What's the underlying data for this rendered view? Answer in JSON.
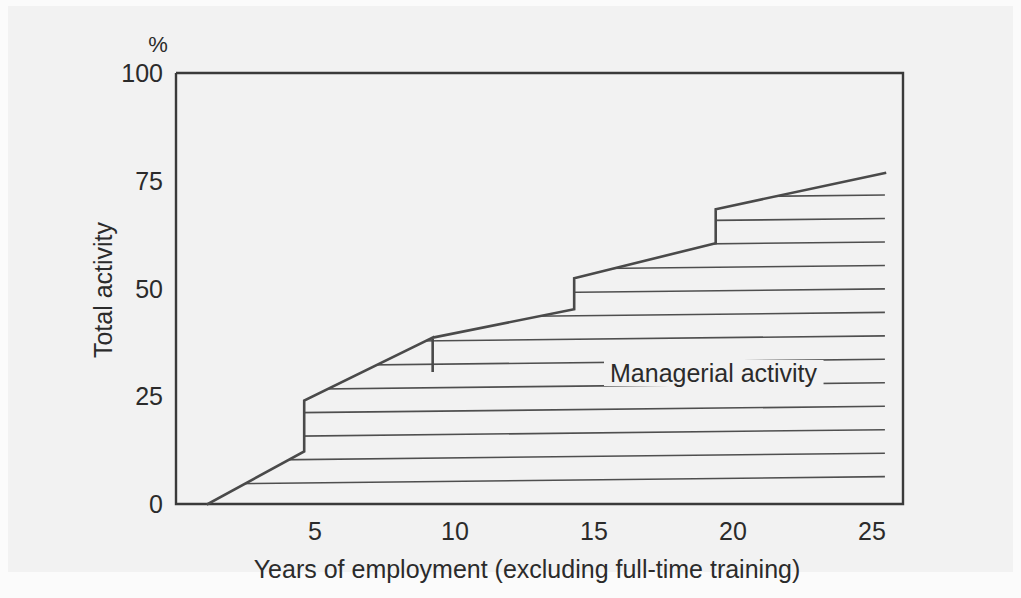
{
  "chart_data": {
    "type": "area",
    "title": "",
    "xlabel": "Years of employment (excluding full-time training)",
    "ylabel": "Total activity",
    "yunit": "%",
    "xlim": [
      0,
      26.2
    ],
    "ylim": [
      0,
      100
    ],
    "xticks": [
      5,
      10,
      15,
      20,
      25
    ],
    "xticklabels": [
      "5",
      "10",
      "15",
      "20",
      "25"
    ],
    "yticks": [
      0,
      25,
      50,
      75,
      100
    ],
    "yticklabels": [
      "0",
      "25",
      "50",
      "75",
      "100"
    ],
    "grid": false,
    "legend": "none",
    "annotations": [
      {
        "text": "Managerial activity",
        "x": 15.6,
        "y": 33.5
      }
    ],
    "series": [
      {
        "name": "Total activity",
        "comment": "Upper staircase boundary: cumulative activity rises linearly then steps up at promotions",
        "points": [
          {
            "x": 1.15,
            "y": 0
          },
          {
            "x": 4.62,
            "y": 12.2
          },
          {
            "x": 4.62,
            "y": 24.0
          },
          {
            "x": 9.25,
            "y": 38.6
          },
          {
            "x": 9.25,
            "y": 30.6
          },
          {
            "x": 9.25,
            "y": 38.6
          },
          {
            "x": 14.35,
            "y": 45.2
          },
          {
            "x": 14.35,
            "y": 52.4
          },
          {
            "x": 19.45,
            "y": 60.5
          },
          {
            "x": 19.45,
            "y": 68.4
          },
          {
            "x": 25.55,
            "y": 76.8
          }
        ],
        "step_x": [
          4.62,
          9.25,
          14.35,
          19.45
        ],
        "step_low": [
          12.2,
          30.6,
          45.2,
          60.5
        ],
        "step_high": [
          24.0,
          38.6,
          52.4,
          68.4
        ]
      },
      {
        "name": "Managerial activity",
        "comment": "Hatched band filling the area under the staircase; drawn as 16 horizontal rules",
        "hatch_lines": 16,
        "hatch_spacing_pct": 5.5
      }
    ]
  },
  "axes": {
    "x_title": "Years of employment (excluding full-time training)",
    "y_title": "Total activity",
    "percent_symbol": "%"
  },
  "labels": {
    "managerial_activity": "Managerial activity",
    "x_5": "5",
    "x_10": "10",
    "x_15": "15",
    "x_20": "20",
    "x_25": "25",
    "y_0": "0",
    "y_25": "25",
    "y_50": "50",
    "y_75": "75",
    "y_100": "100"
  },
  "colors": {
    "line": "#4a4a4a",
    "hatch": "#4f4f4f",
    "frame": "#3a3a3a",
    "text": "#2b2b2b",
    "plate_background": "#f2f2f2",
    "page_background": "#fbfbfb"
  }
}
